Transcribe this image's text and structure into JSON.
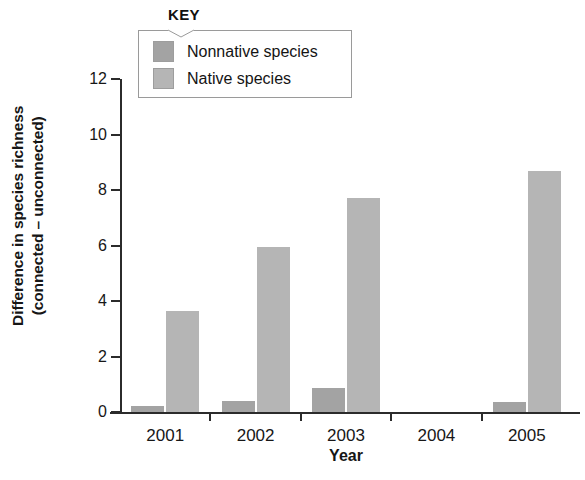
{
  "chart_data": {
    "type": "bar",
    "title": "",
    "xlabel": "Year",
    "ylabel": "Difference in species richness (connected – unconnected)",
    "ylabel_line1": "Difference in species richness",
    "ylabel_line2": "(connected – unconnected)",
    "categories": [
      "2001",
      "2002",
      "2003",
      "2004",
      "2005"
    ],
    "series": [
      {
        "name": "Nonnative species",
        "color": "#a3a3a3",
        "values": [
          0.2,
          0.4,
          0.85,
          0,
          0.35
        ]
      },
      {
        "name": "Native species",
        "color": "#b5b5b5",
        "values": [
          3.65,
          5.95,
          7.7,
          0,
          8.7
        ]
      }
    ],
    "ylim": [
      0,
      12
    ],
    "yticks": [
      0,
      2,
      4,
      6,
      8,
      10,
      12
    ],
    "ytick_labels": [
      "0",
      "2",
      "4",
      "6",
      "8",
      "10",
      "12"
    ],
    "grid": false,
    "legend_position": "top-left-outside",
    "legend_title": "KEY"
  },
  "legend": {
    "title": "KEY",
    "items": [
      {
        "label": "Nonnative species",
        "color": "#a3a3a3"
      },
      {
        "label": "Native species",
        "color": "#b5b5b5"
      }
    ]
  },
  "axes": {
    "x_title": "Year",
    "y_title_line1": "Difference in species richness",
    "y_title_line2": "(connected – unconnected)"
  }
}
